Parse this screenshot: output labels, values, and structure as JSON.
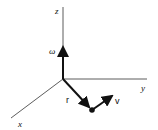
{
  "diagram": {
    "type": "3d-coordinate-vectors",
    "axes": {
      "x": {
        "label": "x"
      },
      "y": {
        "label": "y"
      },
      "z": {
        "label": "z"
      }
    },
    "vectors": {
      "omega": {
        "label": "ω",
        "along": "z"
      },
      "r": {
        "label": "r"
      },
      "v": {
        "label": "v"
      }
    },
    "colors": {
      "stroke": "#111111",
      "axis": "#333333",
      "background": "#ffffff"
    }
  }
}
